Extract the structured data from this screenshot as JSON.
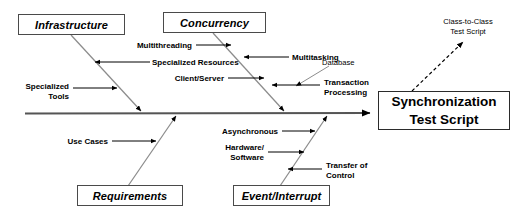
{
  "diagram": {
    "type": "fishbone-ishikawa",
    "colors": {
      "spine": "#555555",
      "bone": "#8c8c8c",
      "arrow": "#000000",
      "box_border": "#4a4a4a",
      "result_border": "#2b2b2b",
      "background": "#ffffff",
      "text": "#000000"
    },
    "effect": {
      "line1": "Synchronization",
      "line2": "Test Script"
    },
    "annotation": {
      "line1": "Class-to-Class",
      "line2": "Test Script",
      "arrow_style": "dashed"
    },
    "categories": [
      {
        "id": "infrastructure",
        "label": "Infrastructure",
        "position": "top-left",
        "causes": [
          {
            "label": "Specialized Resources",
            "align": "left",
            "arrow": "left"
          },
          {
            "label": "Specialized\nTools",
            "align": "right",
            "arrow": "right"
          }
        ]
      },
      {
        "id": "concurrency",
        "label": "Concurrency",
        "position": "top-middle",
        "causes": [
          {
            "label": "Multithreading",
            "align": "right",
            "arrow": "right"
          },
          {
            "label": "Multitasking",
            "align": "left",
            "arrow": "left"
          },
          {
            "label": "Client/Server",
            "align": "right",
            "arrow": "right"
          },
          {
            "label": "Transaction\nProcessing",
            "align": "left",
            "arrow": "left"
          },
          {
            "label": "Database",
            "align": "left",
            "arrow": "left",
            "style": "thin"
          }
        ]
      },
      {
        "id": "requirements",
        "label": "Requirements",
        "position": "bottom-left",
        "causes": [
          {
            "label": "Use Cases",
            "align": "right",
            "arrow": "right"
          }
        ]
      },
      {
        "id": "event-interrupt",
        "label": "Event/Interrupt",
        "position": "bottom-middle",
        "causes": [
          {
            "label": "Asynchronous",
            "align": "right",
            "arrow": "right"
          },
          {
            "label": "Hardware/\nSoftware",
            "align": "right",
            "arrow": "right"
          },
          {
            "label": "Transfer of\nControl",
            "align": "left",
            "arrow": "left"
          }
        ]
      }
    ],
    "labels": {
      "infrastructure": "Infrastructure",
      "concurrency": "Concurrency",
      "requirements": "Requirements",
      "event_interrupt": "Event/Interrupt",
      "specialized_resources": "Specialized Resources",
      "specialized_tools_l1": "Specialized",
      "specialized_tools_l2": "Tools",
      "multithreading": "Multithreading",
      "multitasking": "Multitasking",
      "client_server": "Client/Server",
      "database": "Database",
      "transaction_l1": "Transaction",
      "transaction_l2": "Processing",
      "use_cases": "Use Cases",
      "asynchronous": "Asynchronous",
      "hardware_l1": "Hardware/",
      "hardware_l2": "Software",
      "transfer_l1": "Transfer of",
      "transfer_l2": "Control",
      "class_to_class_l1": "Class-to-Class",
      "class_to_class_l2": "Test Script",
      "effect_l1": "Synchronization",
      "effect_l2": "Test Script"
    }
  }
}
